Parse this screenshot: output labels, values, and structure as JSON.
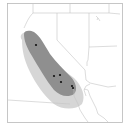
{
  "map": {
    "type": "species-range-map",
    "region": "California and southwestern United States",
    "colors": {
      "background": "#ffffff",
      "frame": "#b8b8b8",
      "border": "#c4c4c4",
      "range_core": "#8f8f8f",
      "range_buffer": "#d6d6d6",
      "occurrence": "#111111"
    },
    "occurrences": [
      {
        "x": 36,
        "y": 45
      },
      {
        "x": 54,
        "y": 76
      },
      {
        "x": 60,
        "y": 75
      },
      {
        "x": 61,
        "y": 82
      },
      {
        "x": 72,
        "y": 86
      },
      {
        "x": 73,
        "y": 88
      }
    ],
    "layers": [
      "state-borders",
      "range-buffer",
      "range-core",
      "occurrence-points"
    ]
  }
}
